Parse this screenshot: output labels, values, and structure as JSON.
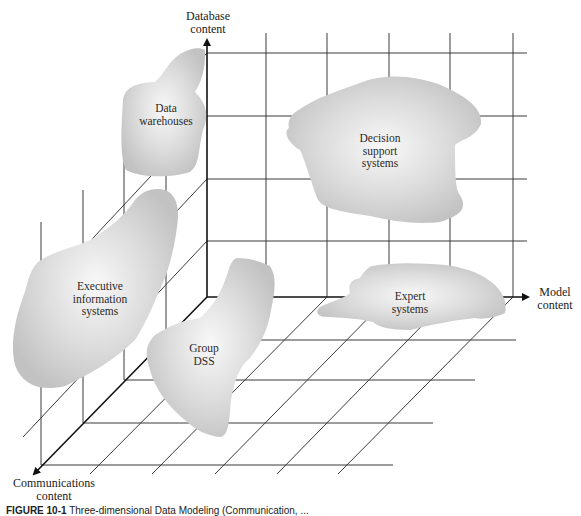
{
  "figure": {
    "type": "3d-concept-diagram",
    "axes": {
      "database": {
        "line1": "Database",
        "line2": "content"
      },
      "model": {
        "line1": "Model",
        "line2": "content"
      },
      "communications": {
        "line1": "Communications",
        "line2": "content"
      }
    },
    "regions": [
      {
        "id": "data-warehouses",
        "lines": [
          "Data",
          "warehouses"
        ]
      },
      {
        "id": "decision-support-systems",
        "lines": [
          "Decision",
          "support",
          "systems"
        ]
      },
      {
        "id": "executive-information-systems",
        "lines": [
          "Executive",
          "information",
          "systems"
        ]
      },
      {
        "id": "group-dss",
        "lines": [
          "Group",
          "DSS"
        ]
      },
      {
        "id": "expert-systems",
        "lines": [
          "Expert",
          "systems"
        ]
      }
    ],
    "caption": {
      "label": "FIGURE 10-1",
      "text": "Three-dimensional Data Modeling (Communication, ..."
    },
    "colors": {
      "grid": "#3a3a3a",
      "axis": "#111111",
      "blob_edge": "#c4c4c4",
      "blob_center": "#f7f7f7",
      "text": "#2a2a2a"
    }
  }
}
